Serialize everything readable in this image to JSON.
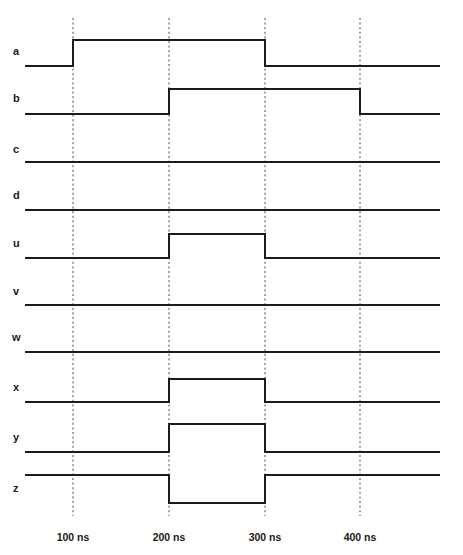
{
  "diagram": {
    "type": "timing-waveform",
    "width": 463,
    "height": 555,
    "background_color": "#ffffff",
    "waveform_color": "#1c1c1c",
    "gridline_color": "#4a4a4a",
    "label_color": "#1a1a1a"
  },
  "time_axis": {
    "unit": "ns",
    "plot_start_x": 25,
    "plot_end_x": 440,
    "tick_spacing_px": 96,
    "ticks": [
      {
        "label": "100 ns",
        "value": 100,
        "x": 73
      },
      {
        "label": "200 ns",
        "value": 200,
        "x": 169
      },
      {
        "label": "300 ns",
        "value": 300,
        "x": 265
      },
      {
        "label": "400 ns",
        "value": 400,
        "x": 360
      }
    ],
    "label_y": 538,
    "gridline_top": 18,
    "gridline_bottom": 516
  },
  "signals": [
    {
      "name": "a",
      "label": "a",
      "label_x": 13,
      "label_y": 52,
      "low_y": 66,
      "high_y": 40,
      "initial_state": "low",
      "transitions": [
        {
          "time": 100,
          "x": 73,
          "edge": "rising"
        },
        {
          "time": 300,
          "x": 265,
          "edge": "falling"
        }
      ],
      "description": "low, rises at 100 ns, falls at 300 ns"
    },
    {
      "name": "b",
      "label": "b",
      "label_x": 13,
      "label_y": 99,
      "low_y": 114,
      "high_y": 89,
      "initial_state": "low",
      "transitions": [
        {
          "time": 200,
          "x": 169,
          "edge": "rising"
        },
        {
          "time": 400,
          "x": 360,
          "edge": "falling"
        }
      ],
      "description": "low, rises at 200 ns, falls at 400 ns"
    },
    {
      "name": "c",
      "label": "c",
      "label_x": 13,
      "label_y": 150,
      "low_y": 162,
      "high_y": 138,
      "initial_state": "low",
      "transitions": [],
      "description": "constant low"
    },
    {
      "name": "d",
      "label": "d",
      "label_x": 13,
      "label_y": 196,
      "low_y": 210,
      "high_y": 186,
      "initial_state": "low",
      "transitions": [],
      "description": "constant low"
    },
    {
      "name": "u",
      "label": "u",
      "label_x": 13,
      "label_y": 244,
      "low_y": 258,
      "high_y": 234,
      "initial_state": "low",
      "transitions": [
        {
          "time": 200,
          "x": 169,
          "edge": "rising"
        },
        {
          "time": 300,
          "x": 265,
          "edge": "falling"
        }
      ],
      "description": "low, pulse high from 200 ns to 300 ns"
    },
    {
      "name": "v",
      "label": "v",
      "label_x": 13,
      "label_y": 292,
      "low_y": 305,
      "high_y": 281,
      "initial_state": "low",
      "transitions": [],
      "description": "constant low"
    },
    {
      "name": "w",
      "label": "w",
      "label_x": 12,
      "label_y": 338,
      "low_y": 352,
      "high_y": 328,
      "initial_state": "low",
      "transitions": [],
      "description": "constant low"
    },
    {
      "name": "x",
      "label": "x",
      "label_x": 13,
      "label_y": 388,
      "low_y": 402,
      "high_y": 379,
      "initial_state": "low",
      "transitions": [
        {
          "time": 200,
          "x": 169,
          "edge": "rising"
        },
        {
          "time": 300,
          "x": 265,
          "edge": "falling"
        }
      ],
      "description": "low, pulse high from 200 ns to 300 ns"
    },
    {
      "name": "y",
      "label": "y",
      "label_x": 13,
      "label_y": 438,
      "low_y": 452,
      "high_y": 424,
      "initial_state": "low",
      "transitions": [
        {
          "time": 200,
          "x": 169,
          "edge": "rising"
        },
        {
          "time": 300,
          "x": 265,
          "edge": "falling"
        }
      ],
      "description": "low, pulse high from 200 ns to 300 ns"
    },
    {
      "name": "z",
      "label": "z",
      "label_x": 13,
      "label_y": 489,
      "low_y": 503,
      "high_y": 475,
      "initial_state": "high",
      "transitions": [
        {
          "time": 200,
          "x": 169,
          "edge": "falling"
        },
        {
          "time": 300,
          "x": 265,
          "edge": "rising"
        }
      ],
      "description": "high, pulse low from 200 ns to 300 ns (inverted)"
    }
  ]
}
